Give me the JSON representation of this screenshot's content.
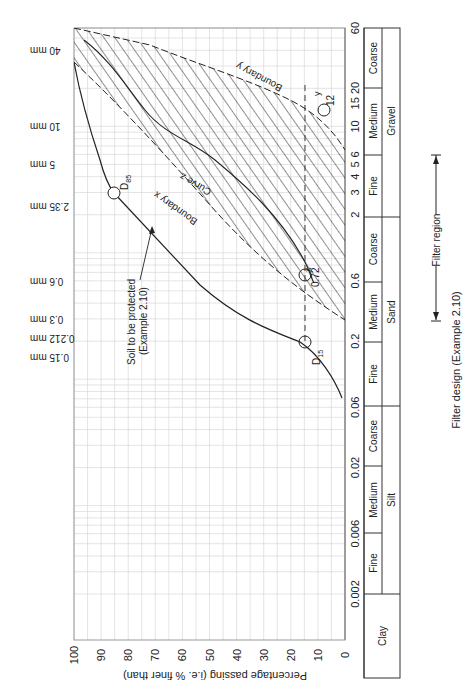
{
  "chart_data": {
    "type": "line",
    "title": "Filter design (Example 2.10)",
    "orientation": "rotated 90° clockwise",
    "xlabel": "Particle size (mm)",
    "ylabel": "Percentage passing (i.e. % finer than)",
    "ylim": [
      0,
      100
    ],
    "y_ticks": [
      0,
      10,
      20,
      30,
      40,
      50,
      60,
      70,
      80,
      90,
      100
    ],
    "x_scale": "log",
    "x_ticks": [
      "0.002",
      "0.006",
      "0.02",
      "0.06",
      "0.2",
      "0.6",
      "2",
      "3",
      "4",
      "5",
      "6",
      "10",
      "15",
      "20",
      "60"
    ],
    "sieve_labels": [
      "40 mm",
      "10 mm",
      "5 mm",
      "2.35 mm",
      "0.6 mm",
      "0.3 mm",
      "0.212 mm",
      "0.15 mm"
    ],
    "series": [
      {
        "name": "Soil to be protected (Example 2.10)",
        "x": [
          0.06,
          0.1,
          0.15,
          0.2,
          0.3,
          0.6,
          1,
          2,
          3,
          5,
          8,
          10
        ],
        "y": [
          2,
          6,
          11,
          15,
          22,
          38,
          52,
          72,
          85,
          93,
          98,
          100
        ]
      },
      {
        "name": "Boundary x",
        "x": [
          0.3,
          0.6,
          1,
          2,
          4,
          8,
          12,
          20
        ],
        "y": [
          0,
          10,
          17,
          30,
          50,
          70,
          85,
          100
        ]
      },
      {
        "name": "Boundary y",
        "x": [
          6,
          10,
          12,
          20,
          30,
          40,
          60
        ],
        "y": [
          0,
          8,
          15,
          40,
          62,
          75,
          100
        ]
      },
      {
        "name": "Curve z",
        "x": [
          0.72,
          2,
          4,
          6,
          10,
          15,
          25,
          40
        ],
        "y": [
          15,
          22,
          35,
          48,
          60,
          62,
          82,
          95
        ]
      }
    ],
    "annotations": [
      "D85",
      "D15",
      "0.72",
      "12",
      "x",
      "y",
      "Boundary x",
      "Boundary y",
      "Curve z",
      "Filter region"
    ],
    "marked_points": [
      {
        "label": "D85",
        "size": 3,
        "percent": 85
      },
      {
        "label": "D15",
        "size": 0.18,
        "percent": 15
      },
      {
        "label": "0.72",
        "size": 0.72,
        "percent": 15
      },
      {
        "label": "12",
        "size": 12,
        "percent": 15
      }
    ],
    "filter_region": {
      "from_size": 0.3,
      "to_size": 6
    },
    "classification": {
      "groups": [
        {
          "name": "Clay",
          "from": 0,
          "to": 0.002
        },
        {
          "name": "Silt",
          "from": 0.002,
          "to": 0.06,
          "subs": [
            "Fine",
            "Medium",
            "Coarse"
          ]
        },
        {
          "name": "Sand",
          "from": 0.06,
          "to": 2,
          "subs": [
            "Fine",
            "Medium",
            "Coarse"
          ]
        },
        {
          "name": "Gravel",
          "from": 2,
          "to": 60,
          "subs": [
            "Fine",
            "Medium",
            "Coarse"
          ]
        }
      ]
    },
    "grid": true
  },
  "labels": {
    "y_axis_title": "Percentage passing (i.e. % finer than)",
    "figure_caption": "Filter design (Example 2.10)",
    "filter_region": "Filter region",
    "soil_line1": "Soil to be protected",
    "soil_line2": "(Example 2.10)",
    "boundary_x": "Boundary x",
    "boundary_y": "Boundary y",
    "curve_z": "Curve z",
    "d85": "D",
    "d85_sub": "85",
    "d15": "D",
    "d15_sub": "15",
    "val_072": "0.72",
    "val_12": "12",
    "mark_x": "x",
    "mark_y": "y",
    "pct": [
      "100",
      "90",
      "80",
      "70",
      "60",
      "50",
      "40",
      "30",
      "20",
      "10",
      "0"
    ],
    "sizes": [
      "60",
      "15 20",
      "10",
      "6",
      "5",
      "4",
      "3",
      "2",
      "0.6",
      "0.2",
      "0.06",
      "0.02",
      "0.006",
      "0.002"
    ],
    "sieves": [
      "40 mm",
      "10 mm",
      "5 mm",
      "2.35 mm",
      "0.6 mm",
      "0.3 mm",
      "0.212 mm",
      "0.15 mm"
    ],
    "classes": {
      "clay": "Clay",
      "silt": "Silt",
      "sand": "Sand",
      "gravel": "Gravel",
      "fine": "Fine",
      "medium": "Medium",
      "coarse": "Coarse"
    }
  }
}
